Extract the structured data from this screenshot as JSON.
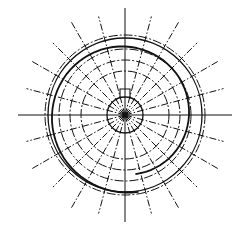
{
  "diagram": {
    "type": "polar-line-drawing",
    "background": "#ffffff",
    "stroke_color": "#111111",
    "center": [
      125,
      115
    ],
    "rays": {
      "count": 24,
      "step_deg": 15,
      "inner_r": 0,
      "outer_r": 105,
      "style": "dash-dot"
    },
    "circles": [
      {
        "r": 18,
        "style": "solid",
        "width": 1.3
      },
      {
        "r": 44,
        "style": "dash-dot",
        "width": 1
      },
      {
        "r": 55,
        "style": "dash-dot",
        "width": 1
      },
      {
        "r": 66,
        "style": "dash-dot",
        "width": 1
      },
      {
        "r": 77,
        "style": "solid",
        "width": 1.3
      },
      {
        "r": 80,
        "style": "dash-dot",
        "width": 1
      }
    ],
    "spiral_curve": {
      "style": "solid",
      "width": 1.8
    },
    "notch": {
      "width": 10,
      "height": 8
    }
  }
}
